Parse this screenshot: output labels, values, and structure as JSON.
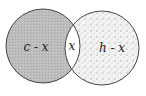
{
  "diagram": {
    "type": "venn",
    "sets": [
      {
        "name": "left-set",
        "region_label": "c - x",
        "fill": "#b8b8b8"
      },
      {
        "name": "right-set",
        "region_label": "h - x",
        "fill": "stipple"
      }
    ],
    "intersection_label": "x"
  }
}
